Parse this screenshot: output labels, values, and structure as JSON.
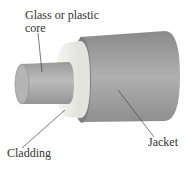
{
  "diagram": {
    "labels": {
      "core_line1": "Glass or plastic",
      "core_line2": "core",
      "cladding": "Cladding",
      "jacket": "Jacket"
    },
    "colors": {
      "jacket": "#9a9a9a",
      "cladding": "#eeeeea",
      "core": "#a8a8a8",
      "leader": "#444444",
      "text": "#333333"
    }
  }
}
